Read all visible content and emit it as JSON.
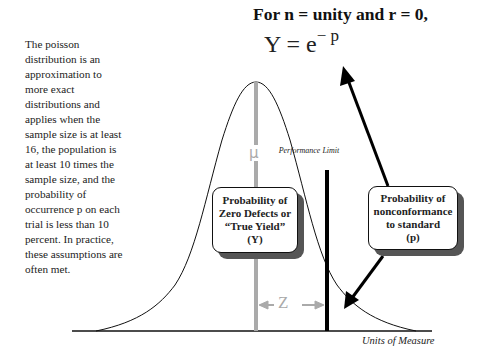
{
  "description": {
    "text": "The poisson distribution is an approximation to more exact distributions and applies when the sample size is at least 16, the population is at least 10 times the sample size, and the probability of occurrence p on each trial is less than 10 percent.  In practice, these assumptions are often met."
  },
  "formula": {
    "heading": "For n = unity and r = 0,",
    "lhs": "Y = e",
    "exponent": "− p"
  },
  "diagram": {
    "mean_label": "μ",
    "z_label": "Z",
    "performance_limit_label": "Performance Limit",
    "x_axis_label": "Units of Measure",
    "yield_box": {
      "line1": "Probability of",
      "line2": "Zero Defects or",
      "line3": "“True Yield”",
      "line4": "(Y)"
    },
    "nonconformance_box": {
      "line1": "Probability of",
      "line2": "nonconformance",
      "line3": "to standard",
      "line4": "(p)"
    },
    "colors": {
      "curve": "#111111",
      "mean_line": "#aaaaaa",
      "limit_line": "#000000",
      "box_shadow": "#555555"
    }
  }
}
